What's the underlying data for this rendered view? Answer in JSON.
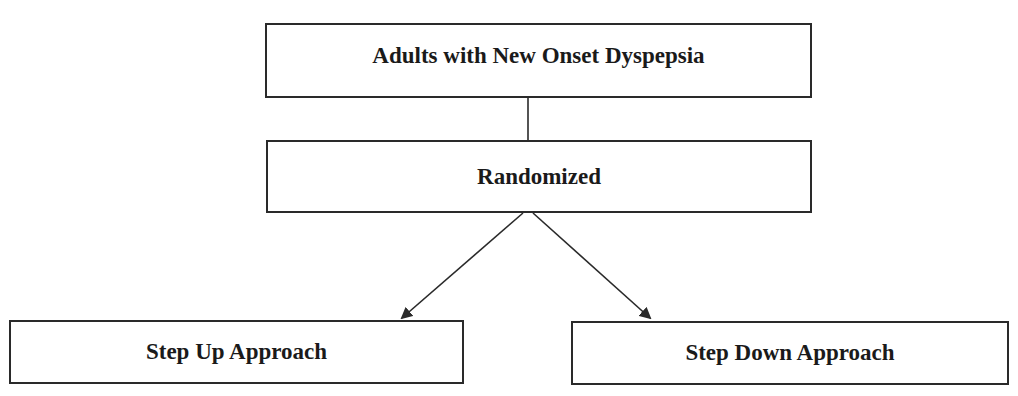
{
  "diagram": {
    "type": "flowchart",
    "caption_fragment": "",
    "nodes": {
      "top": {
        "id": "population",
        "label": "Adults with New Onset Dyspepsia"
      },
      "middle": {
        "id": "randomized",
        "label": "Randomized"
      },
      "left": {
        "id": "step-up",
        "label": "Step Up Approach"
      },
      "right": {
        "id": "step-down",
        "label": "Step Down Approach"
      }
    },
    "edges": [
      {
        "from": "population",
        "to": "randomized",
        "style": "line"
      },
      {
        "from": "randomized",
        "to": "step-up",
        "style": "arrow"
      },
      {
        "from": "randomized",
        "to": "step-down",
        "style": "arrow"
      }
    ],
    "colors": {
      "stroke": "#2a2a2a",
      "text": "#1a1a1a",
      "background": "#ffffff"
    }
  }
}
